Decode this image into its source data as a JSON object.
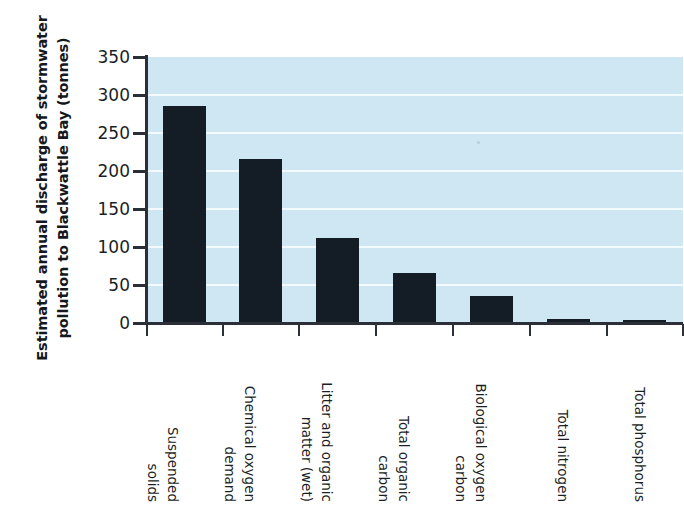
{
  "chart_data": {
    "type": "bar",
    "title": "",
    "xlabel": "",
    "ylabel": "Estimated annual discharge of stormwater pollution to Blackwattle Bay (tonnes)",
    "ylabel_lines": [
      "Estimated annual discharge of stormwater",
      "pollution to Blackwattle Bay (tonnes)"
    ],
    "categories": [
      "Suspended solids",
      "Chemical oxygen demand",
      "Litter and organic matter (wet)",
      "Total organic carbon",
      "Biological oxygen carbon",
      "Total nitrogen",
      "Total phosphorus"
    ],
    "category_lines": [
      [
        "Suspended",
        "solids"
      ],
      [
        "Chemical oxygen",
        "demand"
      ],
      [
        "Litter and organic",
        "matter (wet)"
      ],
      [
        "Total organic",
        "carbon"
      ],
      [
        "Biological oxygen",
        "carbon"
      ],
      [
        "Total nitrogen"
      ],
      [
        "Total phosphorus"
      ]
    ],
    "values": [
      285,
      215,
      111,
      65,
      34,
      4,
      2.5
    ],
    "units": "tonnes",
    "ylim": [
      0,
      350
    ],
    "yticks": [
      0,
      50,
      100,
      150,
      200,
      250,
      300,
      350
    ],
    "ytick_labels": [
      "0",
      "50",
      "100",
      "150",
      "200",
      "250",
      "300",
      "350"
    ],
    "grid": "horizontal",
    "legend": "none",
    "colors": {
      "bar": "#141c26",
      "plot_background": "#cfe6f3",
      "gridline": "#f2fafd",
      "axis": "#2b3038",
      "text": "#1b1f24",
      "page_background": "#ffffff"
    }
  }
}
